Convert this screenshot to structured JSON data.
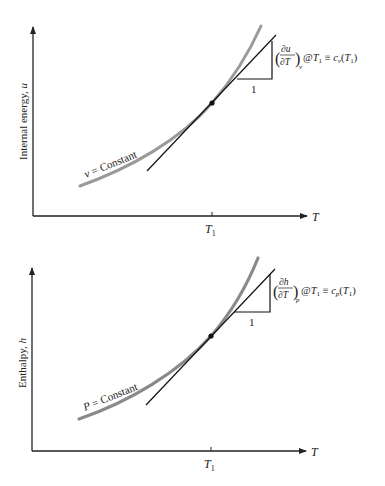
{
  "figures": [
    {
      "id": "internal-energy",
      "ylabel_text": "Internal energy, ",
      "ylabel_var": "u",
      "xlabel": "T",
      "tick_label_main": "T",
      "tick_label_sub": "1",
      "curve_label_var": "v",
      "curve_label_rest": " = Constant",
      "triangle_base_label": "1",
      "derivative": {
        "numerator": "∂u",
        "denominator": "∂T",
        "subscript": "v",
        "at": "@",
        "at_var": "T",
        "at_sub": "1",
        "equiv": " ≡ ",
        "result_var": "c",
        "result_sub": "v",
        "result_arg_open": "(",
        "result_arg_var": "T",
        "result_arg_sub": "1",
        "result_arg_close": ")"
      }
    },
    {
      "id": "enthalpy",
      "ylabel_text": "Enthalpy, ",
      "ylabel_var": "h",
      "xlabel": "T",
      "tick_label_main": "T",
      "tick_label_sub": "1",
      "curve_label_var": "P",
      "curve_label_rest": " = Constant",
      "triangle_base_label": "1",
      "derivative": {
        "numerator": "∂h",
        "denominator": "∂T",
        "subscript": "p",
        "at": "@",
        "at_var": "T",
        "at_sub": "1",
        "equiv": " ≡ ",
        "result_var": "c",
        "result_sub": "p",
        "result_arg_open": "(",
        "result_arg_var": "T",
        "result_arg_sub": "1",
        "result_arg_close": ")"
      }
    }
  ],
  "colors": {
    "axis": "#222222",
    "curve": "#9a9a9a",
    "tangent": "#111111"
  }
}
